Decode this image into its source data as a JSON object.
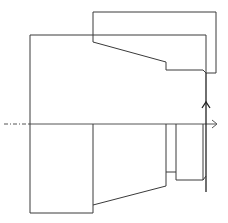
{
  "diagram": {
    "type": "technical-drawing",
    "colors": {
      "line": "#3a3a3a",
      "axis": "#555555",
      "background": "#ffffff"
    },
    "labels": []
  }
}
